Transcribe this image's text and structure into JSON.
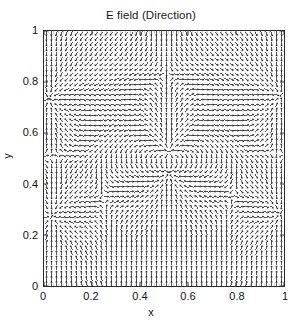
{
  "figure": {
    "title": "E field (Direction)",
    "background_color": "#ffffff",
    "axis_color": "#2b2b2b",
    "arrow_color": "#1a1a1a"
  },
  "axes": {
    "xlabel": "x",
    "ylabel": "y",
    "xticks": [
      "0",
      "0.2",
      "0.4",
      "0.6",
      "0.8",
      "1"
    ],
    "yticks": [
      "0",
      "0.2",
      "0.4",
      "0.6",
      "0.8",
      "1"
    ],
    "xlim": [
      0,
      1
    ],
    "ylim": [
      0,
      1
    ],
    "box": true,
    "grid": false
  },
  "chart_data": {
    "type": "scatter",
    "plot_style": "quiver",
    "title": "E field (Direction)",
    "xlabel": "x",
    "ylabel": "y",
    "xlim": [
      0,
      1
    ],
    "ylim": [
      0,
      1
    ],
    "xticks": [
      0,
      0.2,
      0.4,
      0.6,
      0.8,
      1
    ],
    "yticks": [
      0,
      0.2,
      0.4,
      0.6,
      0.8,
      1
    ],
    "grid": false,
    "legend": null,
    "grid_nx": 48,
    "grid_ny": 50,
    "normalized": true,
    "arrow_length_px": 4.6,
    "charges": [
      {
        "name": "center-source",
        "x": 0.52,
        "y": 0.525,
        "q": 1.0
      },
      {
        "name": "center-sink",
        "x": 0.52,
        "y": 0.445,
        "q": -1.2
      },
      {
        "name": "left-saddle",
        "x": 0.02,
        "y": 0.735,
        "q": -0.3
      },
      {
        "name": "right-saddle",
        "x": 0.985,
        "y": 0.745,
        "q": -0.3
      },
      {
        "name": "lower-left-saddle",
        "x": 0.035,
        "y": 0.275,
        "q": -0.26
      },
      {
        "name": "lower-right-saddle",
        "x": 0.985,
        "y": 0.285,
        "q": -0.26
      },
      {
        "name": "top-outer",
        "x": 0.5,
        "y": 1.35,
        "q": 0.55
      },
      {
        "name": "bottom-outer",
        "x": 0.5,
        "y": -0.38,
        "q": 0.6
      }
    ]
  }
}
